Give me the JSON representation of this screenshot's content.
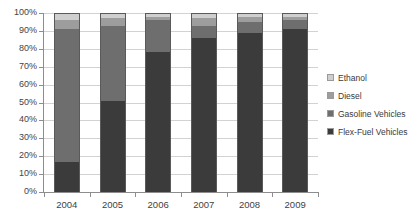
{
  "chart_data": {
    "type": "bar",
    "subtype": "stacked-100-percent",
    "title": "",
    "subtitle": "",
    "xlabel": "",
    "ylabel": "",
    "categories": [
      "2004",
      "2005",
      "2006",
      "2007",
      "2008",
      "2009"
    ],
    "ylim": [
      0,
      100
    ],
    "ytick_labels": [
      "0%",
      "10%",
      "20%",
      "30%",
      "40%",
      "50%",
      "60%",
      "70%",
      "80%",
      "90%",
      "100%"
    ],
    "ytick_values": [
      0,
      10,
      20,
      30,
      40,
      50,
      60,
      70,
      80,
      90,
      100
    ],
    "grid": true,
    "grid_axis": "y",
    "legend_position": "right",
    "stack_order_bottom_to_top": [
      "Flex-Fuel Vehicles",
      "Gasoline Vehicles",
      "Diesel",
      "Ethanol"
    ],
    "series": [
      {
        "name": "Flex-Fuel Vehicles",
        "color": "#3b3b3b",
        "values": [
          17,
          51,
          78,
          86,
          89,
          91
        ]
      },
      {
        "name": "Gasoline Vehicles",
        "color": "#6e6e6e",
        "values": [
          74,
          42,
          18,
          7,
          6,
          5
        ]
      },
      {
        "name": "Diesel",
        "color": "#9d9d9d",
        "values": [
          5,
          4,
          2,
          4,
          3,
          2
        ]
      },
      {
        "name": "Ethanol",
        "color": "#cfcfcf",
        "values": [
          4,
          3,
          2,
          3,
          2,
          2
        ]
      }
    ]
  },
  "legend": {
    "items": [
      {
        "label": "Ethanol",
        "color": "#cfcfcf"
      },
      {
        "label": "Diesel",
        "color": "#9d9d9d"
      },
      {
        "label": "Gasoline Vehicles",
        "color": "#6e6e6e"
      },
      {
        "label": "Flex-Fuel Vehicles",
        "color": "#3b3b3b"
      }
    ]
  },
  "axis": {
    "y_labels": [
      "100%",
      "90%",
      "80%",
      "70%",
      "60%",
      "50%",
      "40%",
      "30%",
      "20%",
      "10%",
      "0%"
    ],
    "x_labels": [
      "2004",
      "2005",
      "2006",
      "2007",
      "2008",
      "2009"
    ]
  }
}
